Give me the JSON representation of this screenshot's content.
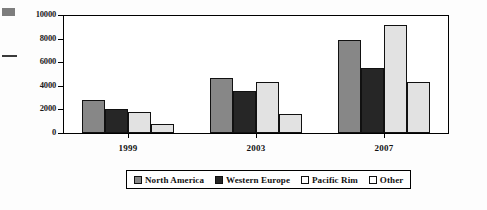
{
  "chart_data": {
    "type": "bar",
    "title": "",
    "subtitle": "",
    "xlabel": "",
    "ylabel": "",
    "categories": [
      "1999",
      "2003",
      "2007"
    ],
    "series": [
      {
        "name": "North America",
        "color": "#878787",
        "values": [
          2800,
          4700,
          7900
        ]
      },
      {
        "name": "Western Europe",
        "color": "#262626",
        "values": [
          2000,
          3550,
          5550
        ]
      },
      {
        "name": "Pacific Rim",
        "color": "#e2e2e2",
        "values": [
          1800,
          4350,
          9150
        ]
      },
      {
        "name": "Other",
        "color": "#e2e2e2",
        "values": [
          750,
          1600,
          4300
        ]
      }
    ],
    "ylim": [
      0,
      10000
    ],
    "yticks": [
      0,
      2000,
      4000,
      6000,
      8000,
      10000
    ],
    "ytick_labels": [
      "0",
      "2000",
      "4000",
      "6000",
      "8000",
      "10000"
    ],
    "grid": false,
    "legend_position": "bottom"
  },
  "legend": {
    "items": [
      {
        "label": "North America",
        "swatch": "#878787"
      },
      {
        "label": "Western Europe",
        "swatch": "#262626"
      },
      {
        "label": "Pacific Rim",
        "swatch": "#ffffff"
      },
      {
        "label": "Other",
        "swatch": "#ffffff"
      }
    ]
  },
  "artifacts": {
    "swatch_color": "#7d7d7d",
    "rule_color": "#3a3a3a"
  }
}
